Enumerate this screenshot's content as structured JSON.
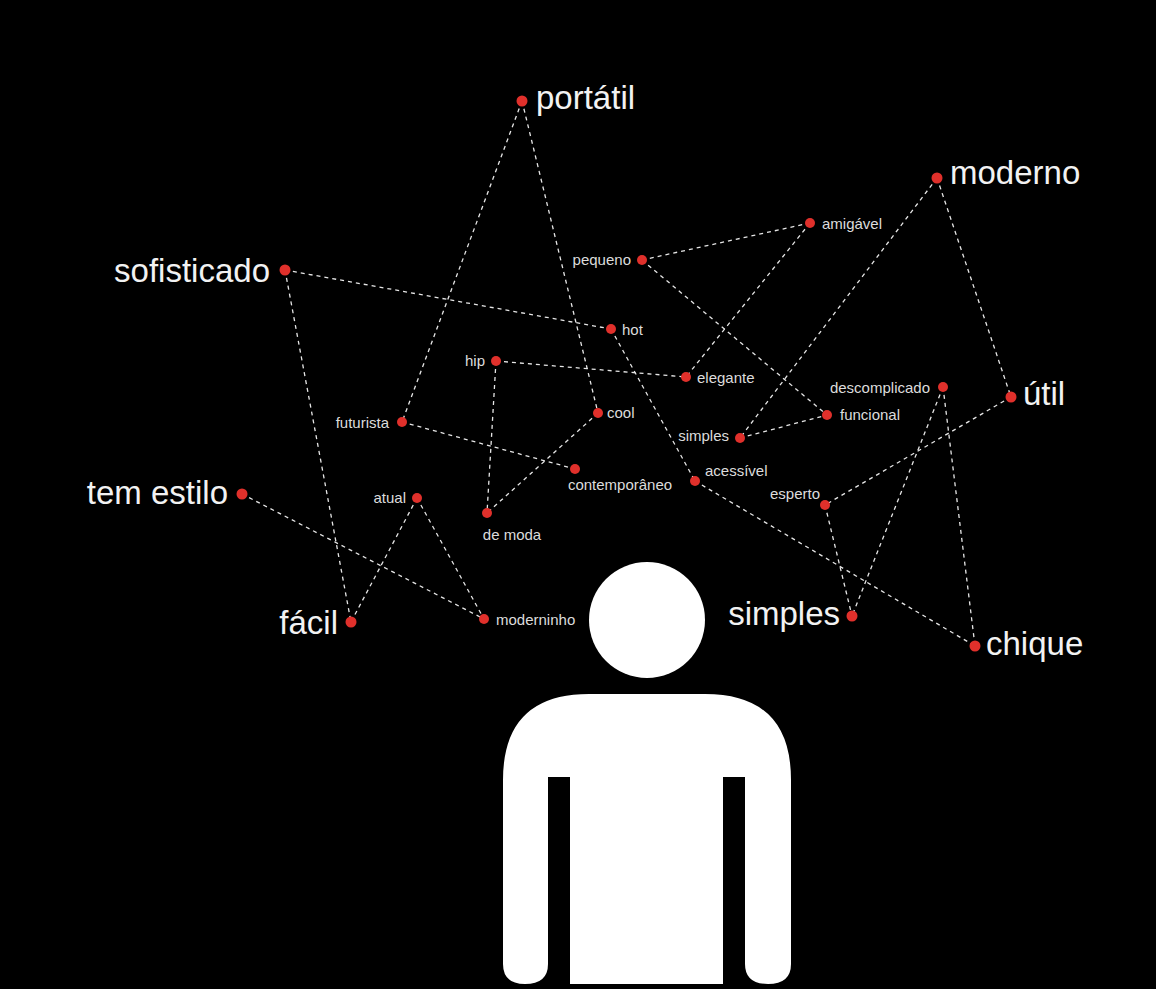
{
  "diagram": {
    "background": "#000000",
    "node_color": "#e0302b",
    "edge_color": "#e6e6e6",
    "nodes": [
      {
        "id": "portatil",
        "label": "portátil",
        "size": "large",
        "x": 522,
        "y": 101,
        "lx": 536,
        "ly": 109,
        "anchor": "start"
      },
      {
        "id": "moderno",
        "label": "moderno",
        "size": "large",
        "x": 937,
        "y": 178,
        "lx": 950,
        "ly": 184,
        "anchor": "start"
      },
      {
        "id": "sofisticado",
        "label": "sofisticado",
        "size": "large",
        "x": 285,
        "y": 270,
        "lx": 270,
        "ly": 282,
        "anchor": "end"
      },
      {
        "id": "tem_estilo",
        "label": "tem estilo",
        "size": "large",
        "x": 242,
        "y": 494,
        "lx": 228,
        "ly": 504,
        "anchor": "end"
      },
      {
        "id": "facil",
        "label": "fácil",
        "size": "large",
        "x": 351,
        "y": 622,
        "lx": 338,
        "ly": 634,
        "anchor": "end"
      },
      {
        "id": "util",
        "label": "útil",
        "size": "large",
        "x": 1011,
        "y": 397,
        "lx": 1023,
        "ly": 405,
        "anchor": "start"
      },
      {
        "id": "simples_large",
        "label": "simples",
        "size": "large",
        "x": 852,
        "y": 616,
        "lx": 840,
        "ly": 625,
        "anchor": "end"
      },
      {
        "id": "chique",
        "label": "chique",
        "size": "large",
        "x": 975,
        "y": 646,
        "lx": 986,
        "ly": 655,
        "anchor": "start"
      },
      {
        "id": "pequeno",
        "label": "pequeno",
        "size": "small",
        "x": 642,
        "y": 260,
        "lx": 631,
        "ly": 265,
        "anchor": "end"
      },
      {
        "id": "amigavel",
        "label": "amigável",
        "size": "small",
        "x": 810,
        "y": 223,
        "lx": 822,
        "ly": 229,
        "anchor": "start"
      },
      {
        "id": "hot",
        "label": "hot",
        "size": "small",
        "x": 611,
        "y": 329,
        "lx": 622,
        "ly": 335,
        "anchor": "start"
      },
      {
        "id": "hip",
        "label": "hip",
        "size": "small",
        "x": 496,
        "y": 361,
        "lx": 485,
        "ly": 366,
        "anchor": "end"
      },
      {
        "id": "elegante",
        "label": "elegante",
        "size": "small",
        "x": 686,
        "y": 377,
        "lx": 697,
        "ly": 383,
        "anchor": "start"
      },
      {
        "id": "cool",
        "label": "cool",
        "size": "small",
        "x": 598,
        "y": 413,
        "lx": 607,
        "ly": 418,
        "anchor": "start"
      },
      {
        "id": "futurista",
        "label": "futurista",
        "size": "small",
        "x": 402,
        "y": 422,
        "lx": 389,
        "ly": 428,
        "anchor": "end"
      },
      {
        "id": "descomplicado",
        "label": "descomplicado",
        "size": "small",
        "x": 943,
        "y": 387,
        "lx": 930,
        "ly": 393,
        "anchor": "end"
      },
      {
        "id": "funcional",
        "label": "funcional",
        "size": "small",
        "x": 827,
        "y": 415,
        "lx": 840,
        "ly": 420,
        "anchor": "start"
      },
      {
        "id": "simples_small",
        "label": "simples",
        "size": "small",
        "x": 740,
        "y": 438,
        "lx": 729,
        "ly": 441,
        "anchor": "end"
      },
      {
        "id": "contemporaneo",
        "label": "contemporâneo",
        "size": "small",
        "x": 575,
        "y": 469,
        "lx": 620,
        "ly": 490,
        "anchor": "middle"
      },
      {
        "id": "acessivel",
        "label": "acessível",
        "size": "small",
        "x": 695,
        "y": 481,
        "lx": 705,
        "ly": 476,
        "anchor": "start"
      },
      {
        "id": "esperto",
        "label": "esperto",
        "size": "small",
        "x": 825,
        "y": 505,
        "lx": 820,
        "ly": 499,
        "anchor": "end"
      },
      {
        "id": "atual",
        "label": "atual",
        "size": "small",
        "x": 417,
        "y": 498,
        "lx": 406,
        "ly": 503,
        "anchor": "end"
      },
      {
        "id": "de_moda",
        "label": "de moda",
        "size": "small",
        "x": 487,
        "y": 513,
        "lx": 512,
        "ly": 540,
        "anchor": "middle"
      },
      {
        "id": "moderninho",
        "label": "moderninho",
        "size": "small",
        "x": 484,
        "y": 619,
        "lx": 496,
        "ly": 625,
        "anchor": "start"
      }
    ],
    "edges": [
      [
        "portatil",
        "futurista"
      ],
      [
        "portatil",
        "cool"
      ],
      [
        "sofisticado",
        "hot"
      ],
      [
        "sofisticado",
        "facil"
      ],
      [
        "moderno",
        "simples_small"
      ],
      [
        "moderno",
        "util"
      ],
      [
        "pequeno",
        "amigavel"
      ],
      [
        "pequeno",
        "funcional"
      ],
      [
        "amigavel",
        "elegante"
      ],
      [
        "hip",
        "elegante"
      ],
      [
        "hip",
        "de_moda"
      ],
      [
        "cool",
        "de_moda"
      ],
      [
        "hot",
        "acessivel"
      ],
      [
        "futurista",
        "contemporaneo"
      ],
      [
        "simples_small",
        "funcional"
      ],
      [
        "descomplicado",
        "simples_large"
      ],
      [
        "descomplicado",
        "chique"
      ],
      [
        "util",
        "esperto"
      ],
      [
        "esperto",
        "simples_large"
      ],
      [
        "acessivel",
        "chique"
      ],
      [
        "tem_estilo",
        "moderninho"
      ],
      [
        "atual",
        "facil"
      ],
      [
        "atual",
        "moderninho"
      ]
    ],
    "person_figure": {
      "head": {
        "cx": 647,
        "cy": 620,
        "r": 58
      },
      "color": "#ffffff"
    }
  }
}
